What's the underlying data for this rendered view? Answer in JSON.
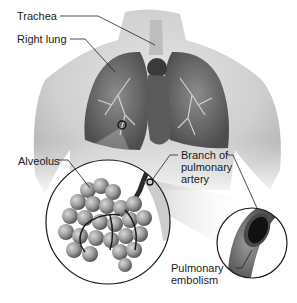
{
  "diagram": {
    "type": "anatomical-illustration",
    "subject": "Pulmonary embolism",
    "labels": {
      "trachea": "Trachea",
      "right_lung": "Right lung",
      "alveolus": "Alveolus",
      "branch_line1": "Branch of",
      "branch_line2": "pulmonary",
      "branch_line3": "artery",
      "embolism_line1": "Pulmonary",
      "embolism_line2": "embolism"
    },
    "colors": {
      "background": "#ffffff",
      "skin": "#d4d4d4",
      "lung": "#6f6f6f",
      "heart": "#3a3a3a",
      "alveoli": "#9a9a9a",
      "clot": "#1a1a1a",
      "leader_line": "#222222"
    }
  }
}
